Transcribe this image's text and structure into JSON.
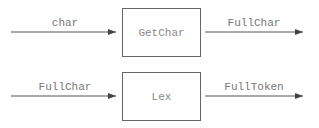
{
  "diagram": {
    "rows": [
      {
        "input_label": "char",
        "process": "GetChar",
        "output_label": "FullChar"
      },
      {
        "input_label": "FullChar",
        "process": "Lex",
        "output_label": "FullToken"
      }
    ],
    "colors": {
      "line": "#555555",
      "text": "#777777"
    }
  }
}
